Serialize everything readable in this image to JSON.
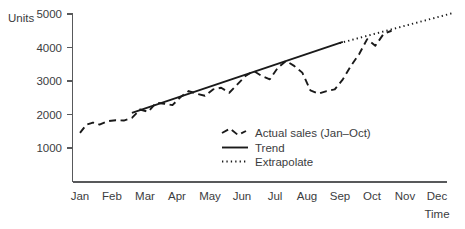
{
  "chart_data": {
    "type": "line",
    "title": "",
    "xlabel": "Time",
    "ylabel": "Units",
    "grid": false,
    "legend_position": "inside-lower-right",
    "ylim": [
      0,
      5000
    ],
    "y_ticks": [
      "1000",
      "2000",
      "3000",
      "4000",
      "5000"
    ],
    "y_tick_values": [
      1000,
      2000,
      3000,
      4000,
      5000
    ],
    "categories": [
      "Jan",
      "Feb",
      "Mar",
      "Apr",
      "May",
      "Jun",
      "Jul",
      "Aug",
      "Sep",
      "Oct",
      "Nov",
      "Dec"
    ],
    "series": [
      {
        "name": "Actual sales (Jan–Oct)",
        "style": "dashed",
        "x": [
          1.0,
          1.2,
          1.4,
          1.6,
          1.85,
          2.1,
          2.35,
          2.6,
          2.85,
          3.1,
          3.35,
          3.6,
          3.85,
          4.1,
          4.35,
          4.6,
          4.85,
          5.1,
          5.35,
          5.6,
          5.85,
          6.1,
          6.35,
          6.6,
          6.85,
          7.1,
          7.35,
          7.6,
          7.85,
          8.1,
          8.35,
          8.6,
          8.85,
          9.1,
          9.35,
          9.6,
          9.85,
          10.1,
          10.35,
          10.6
        ],
        "values": [
          1450,
          1700,
          1760,
          1700,
          1800,
          1830,
          1820,
          1900,
          2150,
          2080,
          2350,
          2320,
          2280,
          2520,
          2700,
          2620,
          2560,
          2750,
          2800,
          2650,
          2900,
          3150,
          3300,
          3150,
          3050,
          3400,
          3600,
          3450,
          3250,
          2720,
          2620,
          2700,
          2750,
          3050,
          3450,
          3800,
          4250,
          4050,
          4400,
          4500
        ]
      },
      {
        "name": "Trend",
        "style": "solid",
        "x": [
          2.6,
          9.1
        ],
        "values": [
          2050,
          4170
        ]
      },
      {
        "name": "Extrapolate",
        "style": "dotted",
        "x": [
          9.0,
          12.5
        ],
        "values": [
          4130,
          5030
        ]
      }
    ],
    "legend": [
      {
        "label": "Actual sales (Jan–Oct)",
        "style": "dashed"
      },
      {
        "label": "Trend",
        "style": "solid"
      },
      {
        "label": "Extrapolate",
        "style": "dotted"
      }
    ],
    "colors": {
      "series": "#1a1a1a",
      "axis": "#58595b",
      "text": "#3b3c3e"
    }
  }
}
